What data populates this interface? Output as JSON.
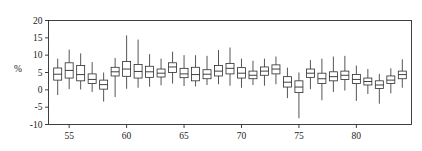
{
  "chart_data": {
    "type": "box",
    "title": "",
    "xlabel": "",
    "ylabel": "%",
    "ylim": [
      -10,
      20
    ],
    "xlim": [
      53.2,
      84.8
    ],
    "ytick_labels": [
      "20",
      "15",
      "10",
      "5",
      "0",
      "-5",
      "-10"
    ],
    "yticks": [
      20,
      15,
      10,
      5,
      0,
      -5,
      -10
    ],
    "xtick_labels": [
      "55",
      "60",
      "65",
      "70",
      "75",
      "80"
    ],
    "xticks": [
      55,
      60,
      65,
      70,
      75,
      80
    ],
    "grid": false,
    "legend": null,
    "frame": "box",
    "box_fill": "#ffffff",
    "line_color": "#2b2b2b",
    "categories": [
      54,
      55,
      56,
      57,
      58,
      59,
      60,
      61,
      62,
      63,
      64,
      65,
      66,
      67,
      68,
      69,
      70,
      71,
      72,
      73,
      74,
      75,
      76,
      77,
      78,
      79,
      80,
      81,
      82,
      83,
      84
    ],
    "boxes": [
      {
        "x": 54,
        "whisker_low": -1.5,
        "q1": 2.8,
        "median": 4.5,
        "q3": 6.3,
        "whisker_high": 9.0
      },
      {
        "x": 55,
        "whisker_low": 0.2,
        "q1": 3.4,
        "median": 5.6,
        "q3": 7.8,
        "whisker_high": 11.6
      },
      {
        "x": 56,
        "whisker_low": 0.1,
        "q1": 2.6,
        "median": 4.4,
        "q3": 7.0,
        "whisker_high": 10.5
      },
      {
        "x": 57,
        "whisker_low": -0.6,
        "q1": 1.8,
        "median": 3.0,
        "q3": 4.6,
        "whisker_high": 8.0
      },
      {
        "x": 58,
        "whisker_low": -3.4,
        "q1": 0.2,
        "median": 1.5,
        "q3": 2.8,
        "whisker_high": 5.0
      },
      {
        "x": 59,
        "whisker_low": -2.1,
        "q1": 4.0,
        "median": 5.2,
        "q3": 6.5,
        "whisker_high": 9.2
      },
      {
        "x": 60,
        "whisker_low": 0.3,
        "q1": 3.9,
        "median": 6.0,
        "q3": 8.2,
        "whisker_high": 15.7
      },
      {
        "x": 61,
        "whisker_low": 0.6,
        "q1": 3.4,
        "median": 5.3,
        "q3": 7.3,
        "whisker_high": 14.5
      },
      {
        "x": 62,
        "whisker_low": 0.9,
        "q1": 3.6,
        "median": 5.2,
        "q3": 6.8,
        "whisker_high": 10.3
      },
      {
        "x": 63,
        "whisker_low": 1.3,
        "q1": 3.7,
        "median": 4.8,
        "q3": 6.0,
        "whisker_high": 9.0
      },
      {
        "x": 64,
        "whisker_low": 1.8,
        "q1": 5.0,
        "median": 6.6,
        "q3": 7.8,
        "whisker_high": 11.0
      },
      {
        "x": 65,
        "whisker_low": 1.1,
        "q1": 3.5,
        "median": 4.6,
        "q3": 6.2,
        "whisker_high": 10.0
      },
      {
        "x": 66,
        "whisker_low": 1.0,
        "q1": 2.6,
        "median": 4.4,
        "q3": 6.5,
        "whisker_high": 10.0
      },
      {
        "x": 67,
        "whisker_low": 1.4,
        "q1": 3.2,
        "median": 4.5,
        "q3": 5.8,
        "whisker_high": 9.8
      },
      {
        "x": 68,
        "whisker_low": 1.6,
        "q1": 4.0,
        "median": 5.4,
        "q3": 7.0,
        "whisker_high": 11.5
      },
      {
        "x": 69,
        "whisker_low": 1.2,
        "q1": 4.6,
        "median": 6.2,
        "q3": 7.6,
        "whisker_high": 12.2
      },
      {
        "x": 70,
        "whisker_low": 0.6,
        "q1": 3.4,
        "median": 4.8,
        "q3": 6.4,
        "whisker_high": 9.0
      },
      {
        "x": 71,
        "whisker_low": 1.4,
        "q1": 3.2,
        "median": 4.2,
        "q3": 5.4,
        "whisker_high": 8.4
      },
      {
        "x": 72,
        "whisker_low": 1.2,
        "q1": 4.2,
        "median": 5.4,
        "q3": 6.6,
        "whisker_high": 9.0
      },
      {
        "x": 73,
        "whisker_low": 1.6,
        "q1": 4.6,
        "median": 6.0,
        "q3": 7.2,
        "whisker_high": 9.6
      },
      {
        "x": 74,
        "whisker_low": -2.4,
        "q1": 0.8,
        "median": 2.2,
        "q3": 3.8,
        "whisker_high": 6.4
      },
      {
        "x": 75,
        "whisker_low": -8.2,
        "q1": -0.8,
        "median": 0.8,
        "q3": 2.6,
        "whisker_high": 5.0
      },
      {
        "x": 76,
        "whisker_low": 0.2,
        "q1": 3.6,
        "median": 4.8,
        "q3": 6.0,
        "whisker_high": 8.6
      },
      {
        "x": 77,
        "whisker_low": -3.0,
        "q1": 1.8,
        "median": 3.2,
        "q3": 4.8,
        "whisker_high": 9.0
      },
      {
        "x": 78,
        "whisker_low": -0.6,
        "q1": 2.6,
        "median": 3.8,
        "q3": 5.2,
        "whisker_high": 9.6
      },
      {
        "x": 79,
        "whisker_low": -0.2,
        "q1": 3.0,
        "median": 4.2,
        "q3": 5.4,
        "whisker_high": 9.8
      },
      {
        "x": 80,
        "whisker_low": -3.2,
        "q1": 1.8,
        "median": 3.0,
        "q3": 4.4,
        "whisker_high": 7.0
      },
      {
        "x": 81,
        "whisker_low": -1.2,
        "q1": 1.4,
        "median": 2.4,
        "q3": 3.4,
        "whisker_high": 6.0
      },
      {
        "x": 82,
        "whisker_low": -4.0,
        "q1": 0.4,
        "median": 1.4,
        "q3": 2.6,
        "whisker_high": 4.6
      },
      {
        "x": 83,
        "whisker_low": -1.0,
        "q1": 1.8,
        "median": 2.8,
        "q3": 4.0,
        "whisker_high": 6.2
      },
      {
        "x": 84,
        "whisker_low": 0.6,
        "q1": 3.2,
        "median": 4.4,
        "q3": 5.4,
        "whisker_high": 8.8
      }
    ]
  }
}
